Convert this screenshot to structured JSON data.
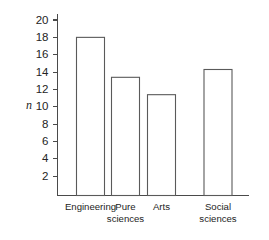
{
  "chart_data": {
    "type": "bar",
    "title": "",
    "xlabel": "",
    "ylabel": "n",
    "categories": [
      "Engineering",
      "Pure sciences",
      "Arts",
      "Social sciences"
    ],
    "values": [
      18,
      13.4,
      11.4,
      14.3
    ],
    "ylim": [
      0,
      21
    ],
    "yticks": [
      2,
      4,
      6,
      8,
      10,
      12,
      14,
      16,
      18,
      20
    ],
    "ytick_labels": [
      "2",
      "4",
      "6",
      "8",
      "10",
      "12",
      "14",
      "16",
      "18",
      "20"
    ],
    "grid": false,
    "legend": false,
    "bar_fill": "#ffffff",
    "bar_stroke": "#5a5a5a",
    "axis_color": "#4a4a4a"
  },
  "axis": {
    "y_label": "n"
  },
  "category_lines": [
    [
      "Engineering"
    ],
    [
      "Pure",
      "sciences"
    ],
    [
      "Arts"
    ],
    [
      "Social",
      "sciences"
    ]
  ]
}
